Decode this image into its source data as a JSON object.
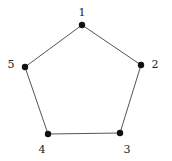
{
  "diagram": {
    "type": "graph",
    "colors": {
      "edge": "#555555",
      "vertex": "#111111",
      "label": "#222222",
      "background": "#ffffff"
    },
    "vertices": [
      {
        "id": "1",
        "label": "1",
        "x": 82,
        "y": 25,
        "label_x": 82,
        "label_y": 16
      },
      {
        "id": "2",
        "label": "2",
        "x": 141,
        "y": 65,
        "label_x": 155,
        "label_y": 68
      },
      {
        "id": "3",
        "label": "3",
        "x": 120,
        "y": 133,
        "label_x": 127,
        "label_y": 153
      },
      {
        "id": "4",
        "label": "4",
        "x": 48,
        "y": 134,
        "label_x": 42,
        "label_y": 153
      },
      {
        "id": "5",
        "label": "5",
        "x": 25,
        "y": 67,
        "label_x": 11,
        "label_y": 68
      }
    ],
    "edges": [
      {
        "from": "1",
        "to": "2"
      },
      {
        "from": "2",
        "to": "3"
      },
      {
        "from": "3",
        "to": "4"
      },
      {
        "from": "4",
        "to": "5"
      },
      {
        "from": "5",
        "to": "1"
      }
    ]
  }
}
